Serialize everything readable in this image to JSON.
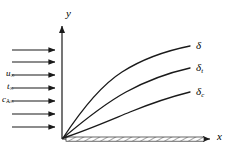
{
  "figure": {
    "type": "boundary-layer-diagram",
    "background_color": "#ffffff",
    "line_color": "#1a1a1a",
    "axes": {
      "y_label": "y",
      "x_label": "x",
      "origin_px": [
        62,
        139
      ],
      "y_axis_top_px": [
        62,
        22
      ],
      "x_axis_right_px": [
        216,
        139
      ]
    },
    "freestream": {
      "arrow_count": 7,
      "arrow_x_start_px": 12,
      "arrow_x_end_px": 60,
      "labels": [
        {
          "name": "velocity",
          "base": "u",
          "subscript": "∞",
          "text": "u∞"
        },
        {
          "name": "temperature",
          "base": "t",
          "subscript": "∞",
          "text": "t∞"
        },
        {
          "name": "concentration",
          "base": "c",
          "subscript": "A∞",
          "text": "cA∞"
        }
      ]
    },
    "curves": [
      {
        "name": "velocity-boundary-layer",
        "label_base": "δ",
        "label_subscript": "",
        "label_text": "δ"
      },
      {
        "name": "thermal-boundary-layer",
        "label_base": "δ",
        "label_subscript": "t",
        "label_text": "δt"
      },
      {
        "name": "concentration-boundary-layer",
        "label_base": "δ",
        "label_subscript": "c",
        "label_text": "δc"
      }
    ],
    "plate": {
      "name": "flat-plate",
      "hatched": true,
      "x_start_px": 66,
      "x_end_px": 204,
      "y_top_px": 137,
      "y_bottom_px": 141
    }
  }
}
